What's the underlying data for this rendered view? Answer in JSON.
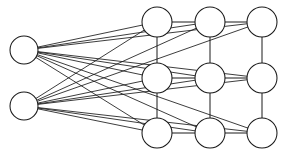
{
  "diagram": {
    "type": "node-link-graph",
    "canvas": {
      "width": 284,
      "height": 157,
      "background": "#ffffff"
    },
    "style": {
      "node_fill": "#ffffff",
      "node_stroke": "#1a1a1a",
      "node_stroke_width": 1.05,
      "edge_stroke": "#1a1a1a",
      "edge_stroke_width": 0.85,
      "lattice_stroke_width": 1.0,
      "node_radius": 14
    },
    "layers": [
      {
        "name": "input-layer",
        "node_count": 2,
        "nodes": [
          {
            "id": "in-1",
            "label": "",
            "cx": 24,
            "cy": 50,
            "r": 14
          },
          {
            "id": "in-2",
            "label": "",
            "cx": 24,
            "cy": 106,
            "r": 14
          }
        ]
      },
      {
        "name": "grid-layer",
        "node_count": 9,
        "rows": 3,
        "cols": 3,
        "nodes": [
          {
            "id": "g-r1c1",
            "label": "",
            "cx": 157,
            "cy": 22,
            "r": 15,
            "row": 0,
            "col": 0
          },
          {
            "id": "g-r1c2",
            "label": "",
            "cx": 210,
            "cy": 22,
            "r": 15,
            "row": 0,
            "col": 1
          },
          {
            "id": "g-r1c3",
            "label": "",
            "cx": 262,
            "cy": 22,
            "r": 15,
            "row": 0,
            "col": 2
          },
          {
            "id": "g-r2c1",
            "label": "",
            "cx": 157,
            "cy": 78,
            "r": 15,
            "row": 1,
            "col": 0
          },
          {
            "id": "g-r2c2",
            "label": "",
            "cx": 210,
            "cy": 78,
            "r": 15,
            "row": 1,
            "col": 1
          },
          {
            "id": "g-r2c3",
            "label": "",
            "cx": 262,
            "cy": 78,
            "r": 15,
            "row": 1,
            "col": 2
          },
          {
            "id": "g-r3c1",
            "label": "",
            "cx": 157,
            "cy": 133,
            "r": 15,
            "row": 2,
            "col": 0
          },
          {
            "id": "g-r3c2",
            "label": "",
            "cx": 210,
            "cy": 133,
            "r": 15,
            "row": 2,
            "col": 1
          },
          {
            "id": "g-r3c3",
            "label": "",
            "cx": 262,
            "cy": 133,
            "r": 15,
            "row": 2,
            "col": 2
          }
        ]
      }
    ],
    "edges": {
      "input_to_grid": [
        {
          "from": "in-1",
          "to": "g-r1c1"
        },
        {
          "from": "in-1",
          "to": "g-r1c2"
        },
        {
          "from": "in-1",
          "to": "g-r1c3"
        },
        {
          "from": "in-1",
          "to": "g-r2c1"
        },
        {
          "from": "in-1",
          "to": "g-r2c2"
        },
        {
          "from": "in-1",
          "to": "g-r2c3"
        },
        {
          "from": "in-1",
          "to": "g-r3c1"
        },
        {
          "from": "in-1",
          "to": "g-r3c2"
        },
        {
          "from": "in-1",
          "to": "g-r3c3"
        },
        {
          "from": "in-2",
          "to": "g-r1c1"
        },
        {
          "from": "in-2",
          "to": "g-r1c2"
        },
        {
          "from": "in-2",
          "to": "g-r1c3"
        },
        {
          "from": "in-2",
          "to": "g-r2c1"
        },
        {
          "from": "in-2",
          "to": "g-r2c2"
        },
        {
          "from": "in-2",
          "to": "g-r2c3"
        },
        {
          "from": "in-2",
          "to": "g-r3c1"
        },
        {
          "from": "in-2",
          "to": "g-r3c2"
        },
        {
          "from": "in-2",
          "to": "g-r3c3"
        }
      ],
      "lattice_horizontal": [
        {
          "from": "g-r1c1",
          "to": "g-r1c2"
        },
        {
          "from": "g-r1c2",
          "to": "g-r1c3"
        },
        {
          "from": "g-r2c1",
          "to": "g-r2c2"
        },
        {
          "from": "g-r2c2",
          "to": "g-r2c3"
        },
        {
          "from": "g-r3c1",
          "to": "g-r3c2"
        },
        {
          "from": "g-r3c2",
          "to": "g-r3c3"
        }
      ],
      "lattice_vertical": [
        {
          "from": "g-r1c1",
          "to": "g-r2c1"
        },
        {
          "from": "g-r2c1",
          "to": "g-r3c1"
        },
        {
          "from": "g-r1c2",
          "to": "g-r2c2"
        },
        {
          "from": "g-r2c2",
          "to": "g-r3c2"
        },
        {
          "from": "g-r1c3",
          "to": "g-r2c3"
        },
        {
          "from": "g-r2c3",
          "to": "g-r3c3"
        }
      ]
    }
  }
}
